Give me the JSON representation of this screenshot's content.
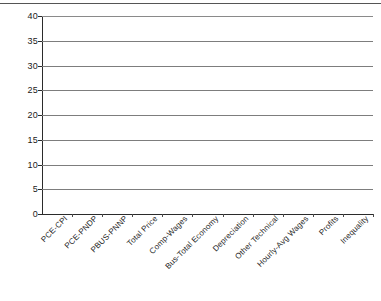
{
  "chart_data": {
    "type": "bar",
    "title": "",
    "xlabel": "",
    "ylabel": "",
    "ylim": [
      0,
      40
    ],
    "ytick_step": 5,
    "yticks": [
      0,
      5,
      10,
      15,
      20,
      25,
      30,
      35,
      40
    ],
    "grid": true,
    "legend": "none",
    "orientation": "vertical",
    "bar_color": "#151515",
    "gridline_color": "#7d7d7d",
    "axis_color": "#2b2b2b",
    "categories": [
      "PCE-CPI",
      "PCE-PNDP",
      "PBUS-PNNP",
      "Total Price",
      "Comp-Wages",
      "Bus-Total Economy",
      "Depreciation",
      "Other Technical",
      "Hourly-Avg Wages",
      "Profits",
      "Inequality"
    ],
    "values": [
      10,
      -0.5,
      26,
      35,
      8.2,
      8.4,
      12,
      28.2,
      30.3,
      7,
      37.3
    ]
  }
}
